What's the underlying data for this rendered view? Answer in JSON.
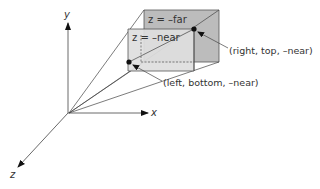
{
  "diagram": {
    "axes": {
      "x_label": "x",
      "y_label": "y",
      "z_label": "z"
    },
    "planes": {
      "far_label": "z = –far",
      "near_label": "z = –near"
    },
    "points": {
      "right_top_near": "(right, top, –near)",
      "left_bottom_near": "(left, bottom, –near)"
    },
    "colors": {
      "far_plane_fill": "#b9b9b9",
      "near_plane_fill": "#dcdcdc",
      "line": "#444444",
      "point": "#111111"
    }
  }
}
